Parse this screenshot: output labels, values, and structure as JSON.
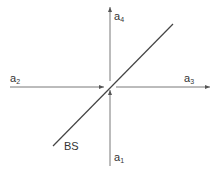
{
  "diagram": {
    "type": "beam-splitter",
    "colors": {
      "line": "#555555",
      "text": "#333333",
      "background": "#ffffff"
    },
    "ports": [
      {
        "id": "a1",
        "base": "a",
        "sub": "1",
        "direction": "input-from-bottom"
      },
      {
        "id": "a2",
        "base": "a",
        "sub": "2",
        "direction": "input-from-left"
      },
      {
        "id": "a3",
        "base": "a",
        "sub": "3",
        "direction": "output-to-right"
      },
      {
        "id": "a4",
        "base": "a",
        "sub": "4",
        "direction": "output-to-top"
      }
    ],
    "splitter_label": "BS"
  }
}
